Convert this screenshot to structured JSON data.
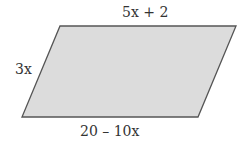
{
  "figure": {
    "shape": "parallelogram",
    "fill_color": "#dcdcdc",
    "stroke_color": "#555555",
    "vertices": {
      "top_left": [
        60,
        26
      ],
      "top_right": [
        236,
        26
      ],
      "bottom_right": [
        198,
        117
      ],
      "bottom_left": [
        22,
        117
      ]
    }
  },
  "labels": {
    "top": "5x + 2",
    "left": "3x",
    "bottom": "20 – 10x"
  }
}
